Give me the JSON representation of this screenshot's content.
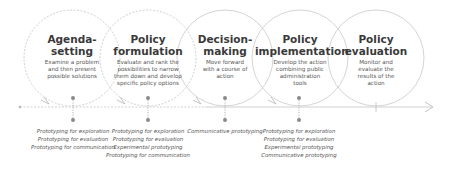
{
  "diagram": {
    "stages": [
      {
        "title_line1": "Agenda-",
        "title_line2": "setting",
        "description": [
          "Examine a problem",
          "and then present",
          "possible solutions"
        ],
        "methods": [
          "Prototyping for exploration",
          "Prototyping for evaluation",
          "Prototyping for communication"
        ],
        "circle_style": "dashed"
      },
      {
        "title_line1": "Policy",
        "title_line2": "formulation",
        "description": [
          "Evaluate and rank the",
          "possibilities to narrow",
          "them down and develop",
          "specific policy options"
        ],
        "methods": [
          "Prototyping for exploration",
          "Prototyping for evaluation",
          "Experimental prototyping",
          "Prototyping for communication"
        ],
        "circle_style": "dashed"
      },
      {
        "title_line1": "Decision-",
        "title_line2": "making",
        "description": [
          "Move forward",
          "with a course of",
          "action"
        ],
        "methods": [
          "Communicative prototyping"
        ],
        "circle_style": "solid"
      },
      {
        "title_line1": "Policy",
        "title_line2": "implementation",
        "description": [
          "Develop the action",
          "combining public",
          "administration",
          "tools"
        ],
        "methods": [
          "Prototyping for exploration",
          "Prototyping for evaluation",
          "Experimental prototyping",
          "Communicative prototyping"
        ],
        "circle_style": "solid"
      },
      {
        "title_line1": "Policy",
        "title_line2": "evaluation",
        "description": [
          "Monitor and",
          "evaluate the",
          "results of the",
          "action"
        ],
        "methods": [],
        "circle_style": "solid"
      }
    ],
    "colors": {
      "circle_stroke": "#c8c8c8",
      "timeline": "#bdbdbd",
      "dot": "#8a8a8a",
      "title_text": "#3a3a3a",
      "body_text": "#555555"
    }
  }
}
